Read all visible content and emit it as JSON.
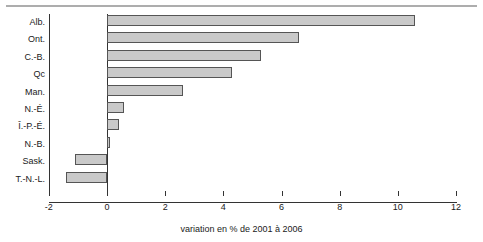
{
  "chart_data": {
    "type": "bar",
    "orientation": "horizontal",
    "title": "",
    "subtitle": "",
    "xlabel": "variation en % de 2001 à  2006",
    "ylabel": "",
    "categories": [
      "Alb.",
      "Ont.",
      "C.-B.",
      "Qc",
      "Man.",
      "N.-É.",
      "Î.-P.-É.",
      "N.-B.",
      "Sask.",
      "T.-N.-L."
    ],
    "values": [
      10.6,
      6.6,
      5.3,
      4.3,
      2.6,
      0.6,
      0.4,
      0.1,
      -1.1,
      -1.4
    ],
    "xlim": [
      -2,
      12
    ],
    "xticks": [
      -2,
      0,
      2,
      4,
      6,
      8,
      10,
      12
    ],
    "xtick_labels": [
      "-2",
      "0",
      "2",
      "4",
      "6",
      "8",
      "10",
      "12"
    ],
    "grid": false,
    "legend": false,
    "bar_fill_color": "#c9c9c9",
    "bar_edge_color": "#555555",
    "axis_color": "#333333",
    "top_rule_color": "#adadad"
  },
  "caption": {
    "x_axis_caption": "variation en % de 2001 à  2006"
  }
}
